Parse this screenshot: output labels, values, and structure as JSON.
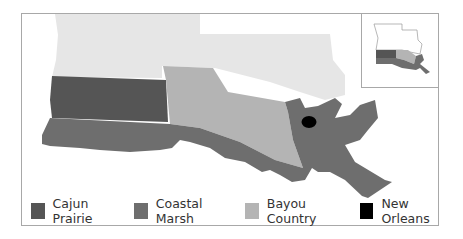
{
  "map": {
    "title": "Louisiana Cultural Regions",
    "colors": {
      "background_state": "#e6e6e6",
      "cajun_prairie": "#555555",
      "coastal_marsh": "#6e6e6e",
      "bayou_country": "#b4b4b4",
      "new_orleans": "#000000",
      "frame_border": "#a8a8a8"
    },
    "regions": [
      {
        "name": "Cajun Prairie",
        "color": "#555555"
      },
      {
        "name": "Coastal Marsh",
        "color": "#6e6e6e"
      },
      {
        "name": "Bayou Country",
        "color": "#b4b4b4"
      },
      {
        "name": "New Orleans",
        "color": "#000000",
        "marker": "dot"
      }
    ],
    "inset": {
      "label": "Louisiana locator map"
    }
  },
  "legend": {
    "items": [
      {
        "label": "Cajun Prairie",
        "color": "#555555"
      },
      {
        "label": "Coastal Marsh",
        "color": "#6e6e6e"
      },
      {
        "label": "Bayou Country",
        "color": "#b4b4b4"
      },
      {
        "label": "New Orleans",
        "color": "#000000"
      }
    ]
  }
}
